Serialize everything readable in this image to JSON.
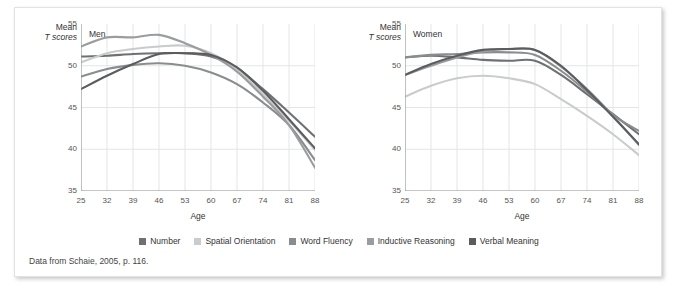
{
  "figure": {
    "caption": "Data from Schaie, 2005, p. 116.",
    "y_axis_title_line1": "Mean",
    "y_axis_title_line2": "T scores",
    "x_axis_title": "Age"
  },
  "legend": {
    "position": "bottom-center",
    "items": [
      {
        "label": "Number",
        "color": "#6f7072"
      },
      {
        "label": "Spatial Orientation",
        "color": "#c9cbcc"
      },
      {
        "label": "Word Fluency",
        "color": "#8a8c8e"
      },
      {
        "label": "Inductive Reasoning",
        "color": "#9a9c9e"
      },
      {
        "label": "Verbal Meaning",
        "color": "#5a5c5e"
      }
    ]
  },
  "chart_data": [
    {
      "type": "line",
      "title": "Men",
      "xlabel": "Age",
      "ylabel": "Mean T scores",
      "x": [
        25,
        32,
        39,
        46,
        53,
        60,
        67,
        74,
        81,
        88
      ],
      "xticks": [
        "25",
        "32",
        "39",
        "46",
        "53",
        "60",
        "67",
        "74",
        "81",
        "88"
      ],
      "yticks": [
        "35",
        "40",
        "45",
        "50",
        "55"
      ],
      "xlim": [
        25,
        88
      ],
      "ylim": [
        35,
        55
      ],
      "grid": true,
      "series": [
        {
          "name": "Number",
          "color": "#6f7072",
          "values": [
            51.1,
            51.2,
            51.4,
            51.5,
            51.5,
            51.1,
            49.7,
            47.2,
            44.4,
            41.5
          ]
        },
        {
          "name": "Spatial Orientation",
          "color": "#c9cbcc",
          "values": [
            50.4,
            51.5,
            52.0,
            52.3,
            52.4,
            51.5,
            49.6,
            46.6,
            43.4,
            39.9
          ]
        },
        {
          "name": "Word Fluency",
          "color": "#8a8c8e",
          "values": [
            48.7,
            49.6,
            50.1,
            50.3,
            50.0,
            49.2,
            47.8,
            45.6,
            42.9,
            38.7
          ]
        },
        {
          "name": "Inductive Reasoning",
          "color": "#9a9c9e",
          "values": [
            52.3,
            53.4,
            53.4,
            53.7,
            52.7,
            51.3,
            49.3,
            46.3,
            42.9,
            37.8
          ]
        },
        {
          "name": "Verbal Meaning",
          "color": "#5a5c5e",
          "values": [
            47.2,
            48.8,
            50.2,
            51.4,
            51.5,
            51.3,
            49.8,
            47.0,
            43.6,
            40.1
          ]
        }
      ]
    },
    {
      "type": "line",
      "title": "Women",
      "xlabel": "Age",
      "ylabel": "Mean T scores",
      "x": [
        25,
        32,
        39,
        46,
        53,
        60,
        67,
        74,
        81,
        88
      ],
      "xticks": [
        "25",
        "32",
        "39",
        "46",
        "53",
        "60",
        "67",
        "74",
        "81",
        "88"
      ],
      "yticks": [
        "35",
        "40",
        "45",
        "50",
        "55"
      ],
      "xlim": [
        25,
        88
      ],
      "ylim": [
        35,
        55
      ],
      "grid": true,
      "series": [
        {
          "name": "Number",
          "color": "#6f7072",
          "values": [
            51.0,
            51.2,
            51.0,
            50.7,
            50.6,
            50.6,
            48.9,
            46.6,
            44.2,
            41.8
          ]
        },
        {
          "name": "Spatial Orientation",
          "color": "#c9cbcc",
          "values": [
            46.3,
            47.6,
            48.5,
            48.8,
            48.5,
            47.8,
            46.0,
            44.0,
            41.8,
            39.3
          ]
        },
        {
          "name": "Word Fluency",
          "color": "#8a8c8e",
          "values": [
            51.0,
            51.3,
            51.4,
            51.6,
            51.6,
            51.3,
            49.4,
            46.9,
            44.1,
            42.2
          ]
        },
        {
          "name": "Inductive Reasoning",
          "color": "#9a9c9e",
          "values": [
            48.9,
            50.0,
            51.0,
            51.7,
            52.0,
            51.9,
            49.9,
            47.2,
            44.0,
            40.5
          ]
        },
        {
          "name": "Verbal Meaning",
          "color": "#5a5c5e",
          "values": [
            48.9,
            50.2,
            51.2,
            51.9,
            52.0,
            51.9,
            50.0,
            47.1,
            43.9,
            40.6
          ]
        }
      ]
    }
  ]
}
